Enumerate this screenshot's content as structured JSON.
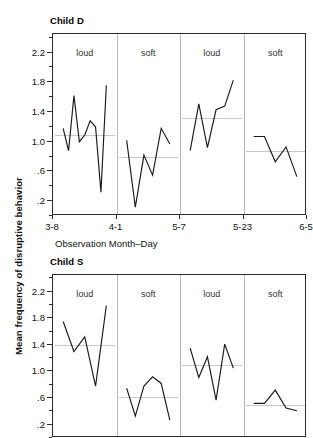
{
  "figure": {
    "y_axis_label": "Mean frequency of disruptive behavior",
    "x_axis_label": "Observation Month–Day"
  },
  "chart_data": [
    {
      "type": "line",
      "title": "Child D",
      "xlabel": "Observation Month–Day",
      "ylabel": "Mean frequency of disruptive behavior",
      "ylim": [
        0.0,
        2.45
      ],
      "yticks": [
        0.2,
        0.6,
        1.0,
        1.4,
        1.8,
        2.2
      ],
      "ytick_labels": [
        ".2",
        ".6",
        "1.0",
        "1.4",
        "1.8",
        "2.2"
      ],
      "xticks": [
        "3-8",
        "4-1",
        "5-7",
        "5-23",
        "6-5"
      ],
      "grid": false,
      "legend": "none",
      "annotations": [
        "loud",
        "soft",
        "loud",
        "soft"
      ],
      "phases": [
        {
          "label": "loud",
          "mean": 1.09,
          "values": [
            1.18,
            0.88,
            1.62,
            1.0,
            1.09,
            1.28,
            1.2,
            0.32,
            1.76
          ]
        },
        {
          "label": "soft",
          "mean": 0.79,
          "values": [
            1.02,
            0.12,
            0.82,
            0.55,
            1.18,
            0.97
          ]
        },
        {
          "label": "loud",
          "mean": 1.32,
          "values": [
            0.88,
            1.51,
            0.92,
            1.43,
            1.48,
            1.83
          ]
        },
        {
          "label": "soft",
          "mean": 0.88,
          "values": [
            1.07,
            1.07,
            0.73,
            0.93,
            0.53
          ]
        }
      ]
    },
    {
      "type": "line",
      "title": "Child S",
      "xlabel": "Observation Month–Day",
      "ylabel": "Mean frequency of disruptive behavior",
      "ylim": [
        0.0,
        2.45
      ],
      "yticks": [
        0.2,
        0.6,
        1.0,
        1.4,
        1.8,
        2.2
      ],
      "ytick_labels": [
        ".2",
        ".6",
        "1.0",
        "1.4",
        "1.8",
        "2.2"
      ],
      "xticks": [
        "3-8",
        "4-1",
        "5-7",
        "5-23",
        "6-5"
      ],
      "grid": false,
      "legend": "none",
      "annotations": [
        "loud",
        "soft",
        "loud",
        "soft"
      ],
      "phases": [
        {
          "label": "loud",
          "mean": 1.4,
          "values": [
            1.75,
            1.3,
            1.52,
            0.78,
            1.99
          ]
        },
        {
          "label": "soft",
          "mean": 0.61,
          "values": [
            0.75,
            0.33,
            0.78,
            0.92,
            0.82,
            0.27
          ]
        },
        {
          "label": "loud",
          "mean": 1.1,
          "values": [
            1.35,
            0.91,
            1.22,
            0.57,
            1.41,
            1.05
          ]
        },
        {
          "label": "soft",
          "mean": 0.5,
          "values": [
            0.52,
            0.52,
            0.72,
            0.45,
            0.41
          ]
        }
      ]
    }
  ]
}
